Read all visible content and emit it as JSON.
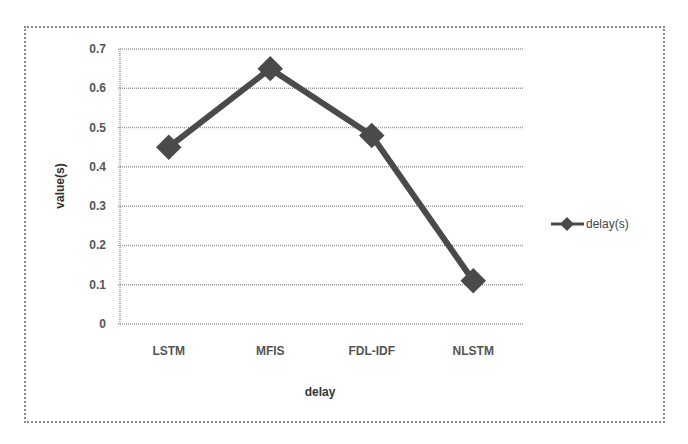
{
  "chart_data": {
    "type": "line",
    "title": "",
    "xlabel": "delay",
    "ylabel": "value(s)",
    "categories": [
      "LSTM",
      "MFIS",
      "FDL-IDF",
      "NLSTM"
    ],
    "series": [
      {
        "name": "delay(s)",
        "values": [
          0.45,
          0.65,
          0.48,
          0.11
        ],
        "color": "#4a4a4a",
        "marker": "diamond"
      }
    ],
    "ylim": [
      0,
      0.7
    ],
    "yticks": [
      "0",
      "0.1",
      "0.2",
      "0.3",
      "0.4",
      "0.5",
      "0.6",
      "0.7"
    ],
    "grid": true,
    "legend_position": "right"
  }
}
